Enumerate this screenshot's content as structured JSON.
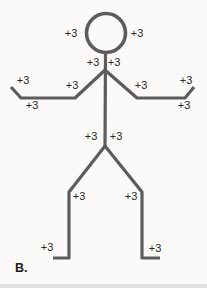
{
  "figure": {
    "caption": "B.",
    "line_color": "#5c5c5c",
    "text_color": "#282828",
    "background": "#fbfaf9",
    "geometry": {
      "head": {
        "cx": 106,
        "cy": 33,
        "r": 19.5
      },
      "body": "105.5,53 105,146",
      "left_arm": "105,70 75,98 21,98 11,87",
      "right_arm": "105,70 137,98 185,98 194,87",
      "left_leg": "105,146 69,192 69,258 53,258",
      "right_leg": "105,146 142,192 142,258 160,258"
    },
    "labels": [
      {
        "name": "head-left",
        "text": "+3",
        "x": 71,
        "y": 33
      },
      {
        "name": "head-right",
        "text": "+3",
        "x": 137,
        "y": 33
      },
      {
        "name": "neck-left",
        "text": "+3",
        "x": 93,
        "y": 62
      },
      {
        "name": "neck-right",
        "text": "+3",
        "x": 114,
        "y": 62
      },
      {
        "name": "left-upper-arm",
        "text": "+3",
        "x": 72,
        "y": 85
      },
      {
        "name": "left-hand",
        "text": "+3",
        "x": 23,
        "y": 80
      },
      {
        "name": "left-forearm",
        "text": "+3",
        "x": 32,
        "y": 105
      },
      {
        "name": "right-upper-arm",
        "text": "+3",
        "x": 141,
        "y": 85
      },
      {
        "name": "right-hand",
        "text": "+3",
        "x": 186,
        "y": 80
      },
      {
        "name": "right-forearm",
        "text": "+3",
        "x": 184,
        "y": 105
      },
      {
        "name": "hip-left",
        "text": "+3",
        "x": 91,
        "y": 136
      },
      {
        "name": "hip-right",
        "text": "+3",
        "x": 116,
        "y": 136
      },
      {
        "name": "knee-left",
        "text": "+3",
        "x": 79,
        "y": 196
      },
      {
        "name": "knee-right",
        "text": "+3",
        "x": 131,
        "y": 196
      },
      {
        "name": "foot-left",
        "text": "+3",
        "x": 47,
        "y": 247
      },
      {
        "name": "foot-right",
        "text": "+3",
        "x": 155,
        "y": 248
      }
    ]
  }
}
